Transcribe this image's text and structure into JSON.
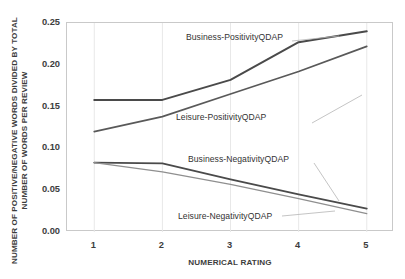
{
  "chart_data": {
    "type": "line",
    "title": "",
    "xlabel": "NUMERICAL RATING",
    "ylabel": "NUMBER OF POSITIVE/NEGATIVE WORDS DIVIDED BY TOTAL NUMBER OF WORDS PER REVIEW",
    "categories": [
      "1",
      "2",
      "3",
      "4",
      "5"
    ],
    "x": [
      1,
      2,
      3,
      4,
      5
    ],
    "xlim": [
      0.6,
      5.4
    ],
    "ylim": [
      0.0,
      0.25
    ],
    "yticks": [
      "0.00",
      "0.05",
      "0.10",
      "0.15",
      "0.20",
      "0.25"
    ],
    "ytick_values": [
      0.0,
      0.05,
      0.1,
      0.15,
      0.2,
      0.25
    ],
    "xticks": [
      "1",
      "2",
      "3",
      "4",
      "5"
    ],
    "grid": "vertical-light",
    "legend": "inline-annotations",
    "series": [
      {
        "name": "Business-PositivityQDAP",
        "values": [
          0.158,
          0.158,
          0.182,
          0.227,
          0.24
        ],
        "color": "#4a4a4a",
        "width": 2.0
      },
      {
        "name": "Leisure-PositivityQDAP",
        "values": [
          0.12,
          0.138,
          0.165,
          0.192,
          0.222
        ],
        "color": "#595959",
        "width": 1.7
      },
      {
        "name": "Business-NegativityQDAP",
        "values": [
          0.083,
          0.082,
          0.063,
          0.045,
          0.028
        ],
        "color": "#4a4a4a",
        "width": 1.8
      },
      {
        "name": "Leisure-NegativityQDAP",
        "values": [
          0.083,
          0.072,
          0.057,
          0.04,
          0.022
        ],
        "color": "#8f8f8f",
        "width": 1.3
      }
    ],
    "annotations": [
      {
        "text": "Business-PositivityQDAP",
        "x_px": 186,
        "y_px": 32
      },
      {
        "text": "Leisure-PositivityQDAP",
        "x_px": 176,
        "y_px": 112
      },
      {
        "text": "Business-NegativityQDAP",
        "x_px": 188,
        "y_px": 154
      },
      {
        "text": "Leisure-NegativityQDAP",
        "x_px": 178,
        "y_px": 211
      }
    ]
  }
}
